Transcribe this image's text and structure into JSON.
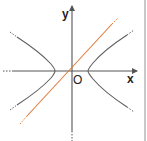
{
  "figure": {
    "type": "hyperbola-with-line",
    "axes": {
      "x_label": "x",
      "y_label": "y",
      "origin_label": "O"
    },
    "colors": {
      "axis": "#555555",
      "hyperbola": "#606060",
      "line": "#e07a3a",
      "border": "#c8c8c8",
      "background": "#ffffff"
    },
    "elements": [
      {
        "name": "x-axis",
        "description": "horizontal axis with arrow pointing right"
      },
      {
        "name": "y-axis",
        "description": "vertical axis with arrow pointing up"
      },
      {
        "name": "hyperbola",
        "description": "two branches opening left and right, symmetric about origin"
      },
      {
        "name": "line",
        "description": "orange straight line through origin with positive slope"
      }
    ]
  }
}
